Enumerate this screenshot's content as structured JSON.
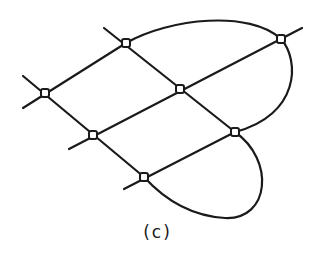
{
  "figure": {
    "caption": "(c)",
    "stroke_color": "#1a1a1a",
    "background": "#ffffff",
    "nodes": [
      {
        "id": "n1",
        "x": 126,
        "y": 43
      },
      {
        "id": "n2",
        "x": 45,
        "y": 93
      },
      {
        "id": "n3",
        "x": 180,
        "y": 89
      },
      {
        "id": "n4",
        "x": 281,
        "y": 39
      },
      {
        "id": "n5",
        "x": 93,
        "y": 135
      },
      {
        "id": "n6",
        "x": 235,
        "y": 132
      },
      {
        "id": "n7",
        "x": 144,
        "y": 177
      }
    ]
  }
}
